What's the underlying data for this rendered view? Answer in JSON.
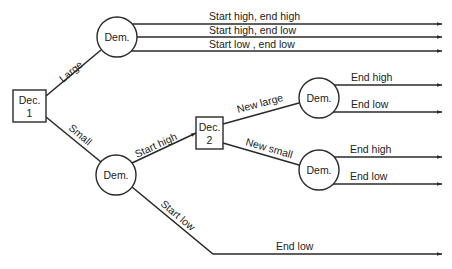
{
  "diagram": {
    "type": "decision-tree",
    "colors": {
      "line": "#2a2a2a",
      "background": "#ffffff",
      "text": "#222222"
    },
    "nodes": {
      "dec1": {
        "kind": "decision",
        "line1": "Dec.",
        "line2": "1"
      },
      "dem_large": {
        "kind": "chance",
        "label": "Dem."
      },
      "dem_small": {
        "kind": "chance",
        "label": "Dem."
      },
      "dec2": {
        "kind": "decision",
        "line1": "Dec.",
        "line2": "2"
      },
      "dem_new_large": {
        "kind": "chance",
        "label": "Dem."
      },
      "dem_new_small": {
        "kind": "chance",
        "label": "Dem."
      }
    },
    "edges": {
      "large": "Large",
      "small": "Small",
      "start_high": "Start high",
      "start_low": "Start low",
      "new_large": "New large",
      "new_small": "New small"
    },
    "outcomes": {
      "large_1": "Start high, end high",
      "large_2": "Start high, end low",
      "large_3": "Start low , end low",
      "new_large_1": "End high",
      "new_large_2": "End low",
      "new_small_1": "End high",
      "new_small_2": "End low",
      "start_low_1": "End low"
    }
  }
}
